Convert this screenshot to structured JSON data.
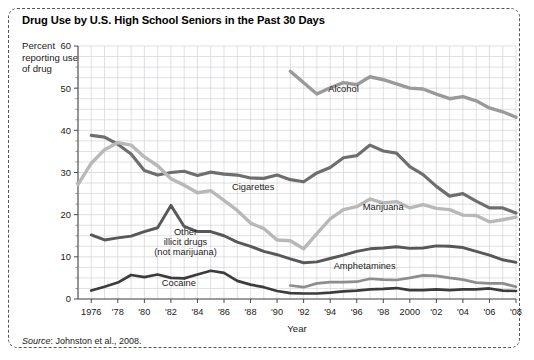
{
  "title": "Drug Use by U.S. High School Seniors in the Past 30 Days",
  "y_axis_label": "Percent reporting use of drug",
  "source": {
    "prefix": "Source",
    "text": ": Johnston et al., 2008."
  },
  "chart_data": {
    "type": "line",
    "title": "Drug Use by U.S. High School Seniors in the Past 30 Days",
    "xlabel": "Year",
    "ylabel": "Percent reporting use of drug",
    "xlim": [
      1975,
      2008
    ],
    "ylim": [
      0,
      60
    ],
    "yticks": [
      0,
      10,
      20,
      30,
      40,
      50,
      60
    ],
    "grid": true,
    "legend": "inline-labels",
    "xticks": [
      1976,
      1978,
      1980,
      1982,
      1984,
      1986,
      1988,
      1990,
      1992,
      1994,
      1996,
      1998,
      2000,
      2002,
      2004,
      2006,
      2008
    ],
    "xticklabels": [
      "1976",
      "'78",
      "'80",
      "'82",
      "'84",
      "'86",
      "'88",
      "'90",
      "'92",
      "'94",
      "'96",
      "'98",
      "2000",
      "'02",
      "'04",
      "'06",
      "'08"
    ],
    "series": [
      {
        "name": "Alcohol",
        "color": "#9a9a9a",
        "width": 3.4,
        "label_x": 1995.0,
        "label_y": 49.0,
        "x": [
          1991,
          1992,
          1993,
          1994,
          1995,
          1996,
          1997,
          1998,
          1999,
          2000,
          2001,
          2002,
          2003,
          2004,
          2005,
          2006,
          2007,
          2008
        ],
        "y": [
          54.0,
          51.3,
          48.6,
          50.1,
          51.3,
          50.8,
          52.7,
          52.0,
          51.0,
          50.0,
          49.8,
          48.6,
          47.5,
          48.0,
          47.0,
          45.3,
          44.4,
          43.1
        ]
      },
      {
        "name": "Cigarettes",
        "color": "#6e6e6e",
        "width": 3.2,
        "label_x": 1988.2,
        "label_y": 25.8,
        "x": [
          1976,
          1977,
          1978,
          1979,
          1980,
          1981,
          1982,
          1983,
          1984,
          1985,
          1986,
          1987,
          1988,
          1989,
          1990,
          1991,
          1992,
          1993,
          1994,
          1995,
          1996,
          1997,
          1998,
          1999,
          2000,
          2001,
          2002,
          2003,
          2004,
          2005,
          2006,
          2007,
          2008
        ],
        "y": [
          38.8,
          38.4,
          36.7,
          34.4,
          30.5,
          29.4,
          30.0,
          30.3,
          29.3,
          30.1,
          29.6,
          29.4,
          28.7,
          28.6,
          29.4,
          28.3,
          27.8,
          29.9,
          31.2,
          33.5,
          34.0,
          36.5,
          35.1,
          34.6,
          31.4,
          29.5,
          26.7,
          24.4,
          25.0,
          23.2,
          21.6,
          21.6,
          20.4
        ]
      },
      {
        "name": "Marijuana",
        "color": "#b8b8b8",
        "width": 3.4,
        "label_x": 1998.0,
        "label_y": 21.2,
        "x": [
          1975,
          1976,
          1977,
          1978,
          1979,
          1980,
          1981,
          1982,
          1983,
          1984,
          1985,
          1986,
          1987,
          1988,
          1989,
          1990,
          1991,
          1992,
          1993,
          1994,
          1995,
          1996,
          1997,
          1998,
          1999,
          2000,
          2001,
          2002,
          2003,
          2004,
          2005,
          2006,
          2007,
          2008
        ],
        "y": [
          27.1,
          32.2,
          35.4,
          37.1,
          36.5,
          33.7,
          31.6,
          28.5,
          27.0,
          25.2,
          25.7,
          23.4,
          21.0,
          18.0,
          16.7,
          14.0,
          13.8,
          11.9,
          15.5,
          19.0,
          21.2,
          21.9,
          23.7,
          22.8,
          23.1,
          21.6,
          22.4,
          21.5,
          21.2,
          19.9,
          19.8,
          18.3,
          18.8,
          19.4
        ]
      },
      {
        "name": "Other illicit drugs (not marijuana)",
        "label_lines": [
          "Other",
          "illicit drugs",
          "(not marijuana)"
        ],
        "color": "#585858",
        "width": 2.9,
        "label_x": 1983.1,
        "label_y": 15.2,
        "x": [
          1976,
          1977,
          1978,
          1979,
          1980,
          1981,
          1982,
          1983,
          1984,
          1985,
          1986,
          1987,
          1988,
          1989,
          1990,
          1991,
          1992,
          1993,
          1994,
          1995,
          1996,
          1997,
          1998,
          1999,
          2000,
          2001,
          2002,
          2003,
          2004,
          2005,
          2006,
          2007,
          2008
        ],
        "y": [
          15.2,
          14.0,
          14.5,
          14.9,
          16.0,
          16.9,
          22.2,
          17.2,
          16.0,
          16.0,
          15.0,
          13.5,
          12.5,
          11.3,
          10.5,
          9.5,
          8.6,
          8.8,
          9.6,
          10.4,
          11.3,
          11.9,
          12.1,
          12.4,
          12.0,
          12.1,
          12.6,
          12.5,
          12.2,
          11.3,
          10.4,
          9.3,
          8.7
        ]
      },
      {
        "name": "Amphetamines",
        "color": "#8d8d8d",
        "width": 2.7,
        "label_x": 1996.6,
        "label_y": 7.0,
        "x": [
          1991,
          1992,
          1993,
          1994,
          1995,
          1996,
          1997,
          1998,
          1999,
          2000,
          2001,
          2002,
          2003,
          2004,
          2005,
          2006,
          2007,
          2008
        ],
        "y": [
          3.2,
          2.8,
          3.7,
          4.0,
          4.0,
          4.1,
          4.8,
          4.6,
          4.5,
          5.0,
          5.6,
          5.5,
          5.0,
          4.6,
          3.9,
          3.7,
          3.7,
          2.9
        ]
      },
      {
        "name": "Cocaine",
        "color": "#3c3c3c",
        "width": 2.7,
        "label_x": 1982.6,
        "label_y": 3.2,
        "x": [
          1976,
          1977,
          1978,
          1979,
          1980,
          1981,
          1982,
          1983,
          1984,
          1985,
          1986,
          1987,
          1988,
          1989,
          1990,
          1991,
          1992,
          1993,
          1994,
          1995,
          1996,
          1997,
          1998,
          1999,
          2000,
          2001,
          2002,
          2003,
          2004,
          2005,
          2006,
          2007,
          2008
        ],
        "y": [
          2.0,
          2.9,
          3.9,
          5.7,
          5.2,
          5.8,
          5.0,
          4.9,
          5.8,
          6.7,
          6.2,
          4.3,
          3.4,
          2.8,
          1.9,
          1.4,
          1.3,
          1.3,
          1.5,
          1.8,
          2.0,
          2.3,
          2.4,
          2.6,
          2.1,
          2.1,
          2.3,
          2.1,
          2.3,
          2.3,
          2.5,
          2.0,
          1.9
        ]
      }
    ]
  }
}
